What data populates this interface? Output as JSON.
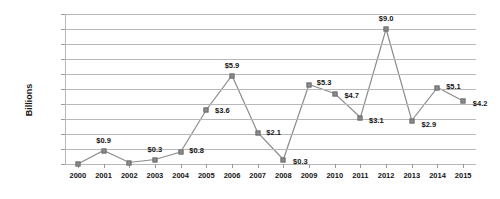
{
  "chart_data": {
    "type": "line",
    "title": "",
    "xlabel": "",
    "ylabel": "Billions",
    "ylim": [
      0,
      10
    ],
    "ytick_values": [
      0,
      1,
      2,
      3,
      4,
      5,
      6,
      7,
      8,
      9,
      10
    ],
    "ytick_labels": [
      "$-",
      "$1.0",
      "$2.0",
      "$3.0",
      "$4.0",
      "$5.0",
      "$6.0",
      "$7.0",
      "$8.0",
      "$9.0",
      "$10.0"
    ],
    "grid": true,
    "legend": "none",
    "categories": [
      "2000",
      "2001",
      "2002",
      "2003",
      "2004",
      "2005",
      "2006",
      "2007",
      "2008",
      "2009",
      "2010",
      "2011",
      "2012",
      "2013",
      "2014",
      "2015"
    ],
    "values": [
      0.0,
      0.9,
      0.1,
      0.3,
      0.8,
      3.6,
      5.9,
      2.1,
      0.3,
      5.3,
      4.7,
      3.1,
      9.0,
      2.9,
      5.1,
      4.2
    ],
    "point_labels": [
      "",
      "$0.9",
      "",
      "$0.3",
      "$0.8",
      "$3.6",
      "$5.9",
      "$2.1",
      "$0.3",
      "$5.3",
      "$4.7",
      "$3.1",
      "$9.0",
      "$2.9",
      "$5.1",
      "$4.2"
    ],
    "series_color": "#8c8c8c",
    "grid_color": "#b8b8b8",
    "text_color": "#151515"
  }
}
